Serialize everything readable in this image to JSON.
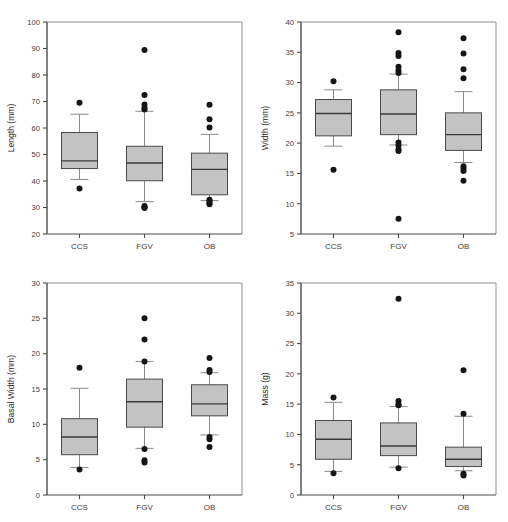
{
  "figure": {
    "title": "",
    "background": "#ffffff",
    "box_fill": "#c3c3c3",
    "box_stroke": "#4a4a4a",
    "median_color": "#3a3a3a",
    "whisker_color": "#8a8a8a",
    "outlier_color": "#151515",
    "layout": "2x2 grid of box plots",
    "categories": [
      "CCS",
      "FGV",
      "OB"
    ]
  },
  "chart_data": [
    {
      "type": "box",
      "panel": "top-left",
      "title": "",
      "xlabel": "",
      "ylabel": "Length (mm)",
      "ylim": [
        20,
        100
      ],
      "yticks": [
        20,
        30,
        40,
        50,
        60,
        70,
        80,
        90,
        100
      ],
      "grid": false,
      "legend": "none",
      "categories": [
        "CCS",
        "FGV",
        "OB"
      ],
      "boxes": [
        {
          "name": "CCS",
          "whisker_low": 40.6,
          "q1": 44.7,
          "median": 47.6,
          "q3": 58.3,
          "whisker_high": 65.2,
          "outliers": [
            69.5,
            37.2
          ]
        },
        {
          "name": "FGV",
          "whisker_low": 32.2,
          "q1": 40.1,
          "median": 46.8,
          "q3": 53.1,
          "whisker_high": 66.3,
          "outliers": [
            89.4,
            72.5,
            68.9,
            67.6,
            67.0,
            30.6,
            30.1,
            29.8
          ]
        },
        {
          "name": "OB",
          "whisker_low": 32.6,
          "q1": 34.8,
          "median": 44.4,
          "q3": 50.5,
          "whisker_high": 57.6,
          "outliers": [
            68.8,
            63.3,
            60.2,
            32.9,
            32.4,
            31.6,
            31.2
          ]
        }
      ]
    },
    {
      "type": "box",
      "panel": "top-right",
      "title": "",
      "xlabel": "",
      "ylabel": "Width (mm)",
      "ylim": [
        5,
        40
      ],
      "yticks": [
        5,
        10,
        15,
        20,
        25,
        30,
        35,
        40
      ],
      "grid": false,
      "legend": "none",
      "categories": [
        "CCS",
        "FGV",
        "OB"
      ],
      "boxes": [
        {
          "name": "CCS",
          "whisker_low": 19.5,
          "q1": 21.2,
          "median": 24.9,
          "q3": 27.2,
          "whisker_high": 28.8,
          "outliers": [
            30.2,
            15.6
          ]
        },
        {
          "name": "FGV",
          "whisker_low": 19.7,
          "q1": 21.4,
          "median": 24.8,
          "q3": 28.8,
          "whisker_high": 31.4,
          "outliers": [
            38.3,
            34.9,
            34.4,
            32.6,
            32.0,
            31.6,
            20.1,
            19.6,
            19.0,
            18.7,
            7.5
          ]
        },
        {
          "name": "OB",
          "whisker_low": 16.8,
          "q1": 18.8,
          "median": 21.4,
          "q3": 25.0,
          "whisker_high": 28.5,
          "outliers": [
            37.3,
            34.8,
            32.2,
            30.7,
            16.2,
            15.8,
            15.4,
            13.8
          ]
        }
      ]
    },
    {
      "type": "box",
      "panel": "bottom-left",
      "title": "",
      "xlabel": "",
      "ylabel": "Basal Width (mm)",
      "ylim": [
        0,
        30
      ],
      "yticks": [
        0,
        5,
        10,
        15,
        20,
        25,
        30
      ],
      "grid": false,
      "legend": "none",
      "categories": [
        "CCS",
        "FGV",
        "OB"
      ],
      "boxes": [
        {
          "name": "CCS",
          "whisker_low": 3.9,
          "q1": 5.7,
          "median": 8.2,
          "q3": 10.8,
          "whisker_high": 15.1,
          "outliers": [
            18.0,
            3.6
          ]
        },
        {
          "name": "FGV",
          "whisker_low": 6.6,
          "q1": 9.6,
          "median": 13.2,
          "q3": 16.4,
          "whisker_high": 18.9,
          "outliers": [
            25.0,
            22.0,
            18.9,
            6.5,
            4.9,
            4.6
          ]
        },
        {
          "name": "OB",
          "whisker_low": 8.5,
          "q1": 11.2,
          "median": 12.9,
          "q3": 15.6,
          "whisker_high": 17.3,
          "outliers": [
            19.4,
            17.7,
            17.4,
            8.2,
            7.9,
            6.8
          ]
        }
      ]
    },
    {
      "type": "box",
      "panel": "bottom-right",
      "title": "",
      "xlabel": "",
      "ylabel": "Mass (g)",
      "ylim": [
        0,
        35
      ],
      "yticks": [
        0,
        5,
        10,
        15,
        20,
        25,
        30,
        35
      ],
      "grid": false,
      "legend": "none",
      "categories": [
        "CCS",
        "FGV",
        "OB"
      ],
      "boxes": [
        {
          "name": "CCS",
          "whisker_low": 3.9,
          "q1": 5.9,
          "median": 9.2,
          "q3": 12.3,
          "whisker_high": 15.3,
          "outliers": [
            16.1,
            3.6
          ]
        },
        {
          "name": "FGV",
          "whisker_low": 4.6,
          "q1": 6.5,
          "median": 8.1,
          "q3": 11.9,
          "whisker_high": 14.6,
          "outliers": [
            32.4,
            15.5,
            15.0,
            14.8,
            4.4
          ]
        },
        {
          "name": "OB",
          "whisker_low": 4.0,
          "q1": 4.7,
          "median": 5.9,
          "q3": 7.9,
          "whisker_high": 13.0,
          "outliers": [
            20.6,
            13.4,
            3.5,
            3.2
          ]
        }
      ]
    }
  ]
}
